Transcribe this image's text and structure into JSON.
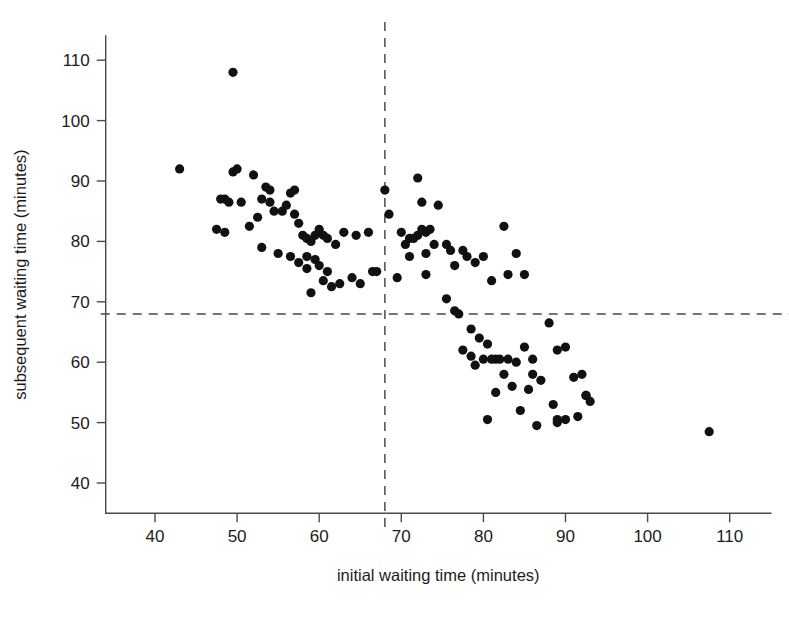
{
  "figure": {
    "width": 789,
    "height": 617,
    "background": "#ffffff",
    "point_color": "#111111",
    "axis_color": "#4a4a4a",
    "text_color": "#1c1c1c"
  },
  "chart_data": {
    "type": "scatter",
    "title": "",
    "subtitle": "",
    "xlabel": "initial waiting time (minutes)",
    "ylabel": "subsequent waiting time (minutes)",
    "xlim": [
      34,
      115
    ],
    "ylim": [
      35,
      114
    ],
    "xticks": [
      40,
      50,
      60,
      70,
      80,
      90,
      100,
      110
    ],
    "xtick_labels": [
      "40",
      "50",
      "60",
      "70",
      "80",
      "90",
      "100",
      "110"
    ],
    "yticks": [
      40,
      50,
      60,
      70,
      80,
      90,
      100,
      110
    ],
    "ytick_labels": [
      "40",
      "50",
      "60",
      "70",
      "80",
      "90",
      "100",
      "110"
    ],
    "grid": false,
    "legend": null,
    "marker": {
      "shape": "circle",
      "radius_px": 4.6,
      "color": "#111111",
      "filled": true
    },
    "annotations": [
      {
        "name": "vertical-reference-line",
        "orientation": "vertical",
        "value": 68,
        "style": "dashed",
        "color": "#4a4a4a"
      },
      {
        "name": "horizontal-reference-line",
        "orientation": "horizontal",
        "value": 68,
        "style": "dashed",
        "color": "#4a4a4a"
      }
    ],
    "x": [
      43,
      49.5,
      48,
      48.5,
      49,
      49.5,
      50,
      52,
      53.5,
      54,
      47.5,
      48.5,
      50.5,
      53,
      54,
      55.5,
      56,
      57,
      52.5,
      54.5,
      56.5,
      57,
      57.5,
      58,
      58.5,
      59,
      59.5,
      60,
      60.5,
      61,
      58.5,
      59.5,
      60,
      61,
      62,
      63,
      64.5,
      66,
      67,
      60.5,
      62.5,
      64,
      65,
      66.5,
      55,
      56.5,
      57.5,
      58.5,
      59,
      51.5,
      53,
      61.5,
      68,
      68.5,
      70,
      71,
      72,
      72.5,
      73,
      73.5,
      71.5,
      72.5,
      73,
      74,
      74.5,
      75.5,
      76,
      69.5,
      70.5,
      71,
      72,
      73,
      76.5,
      77.5,
      78,
      79,
      80,
      81,
      75.5,
      76.5,
      77,
      78.5,
      79.5,
      80.5,
      81.5,
      82.5,
      83,
      84,
      85,
      86,
      77.5,
      78.5,
      79,
      80,
      81,
      82,
      83,
      84,
      85,
      86,
      87,
      88,
      89,
      90,
      91,
      92,
      92.5,
      93,
      80.5,
      81.5,
      82.5,
      83.5,
      84.5,
      85.5,
      86.5,
      88.5,
      89,
      90,
      91.5,
      92.5,
      89,
      107.5
    ],
    "y": [
      92,
      108,
      87,
      87,
      86.5,
      91.5,
      92,
      91,
      89,
      88.5,
      82,
      81.5,
      86.5,
      87,
      86.5,
      85,
      86,
      88.5,
      84,
      85,
      88,
      84.5,
      83,
      81,
      80.5,
      80,
      81,
      82,
      81,
      80.5,
      77.5,
      77,
      76,
      75,
      79.5,
      81.5,
      81,
      81.5,
      75,
      73.5,
      73,
      74,
      73,
      75,
      78,
      77.5,
      76.5,
      75.5,
      71.5,
      82.5,
      79,
      72.5,
      88.5,
      84.5,
      81.5,
      80.5,
      90.5,
      86.5,
      81.5,
      82,
      80.5,
      82,
      78,
      79.5,
      86,
      79.5,
      78.5,
      74,
      79.5,
      77.5,
      81,
      74.5,
      76,
      78.5,
      77.5,
      76.5,
      77.5,
      73.5,
      70.5,
      68.5,
      68,
      65.5,
      64,
      63,
      60.5,
      82.5,
      74.5,
      78,
      74.5,
      60.5,
      62,
      61,
      59.5,
      60.5,
      60.5,
      60.5,
      60.5,
      60,
      62.5,
      58,
      57,
      66.5,
      62,
      62.5,
      57.5,
      58,
      54.5,
      53.5,
      50.5,
      55,
      58,
      56,
      52,
      55.5,
      49.5,
      53,
      50.5,
      50.5,
      51,
      54.5,
      50,
      48.5,
      43.5,
      71.5
    ]
  }
}
